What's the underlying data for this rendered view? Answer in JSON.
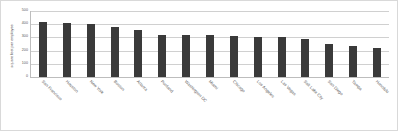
{
  "chart_data": {
    "type": "bar",
    "title": "",
    "xlabel": "",
    "ylabel": "square feet per employee",
    "ylim": [
      0,
      500
    ],
    "yticks": [
      500,
      400,
      300,
      200,
      100,
      0
    ],
    "grid": true,
    "legend": false,
    "orientation": "vertical",
    "bar_color": "#3a3a3a",
    "categories": [
      "San Francisco",
      "Houston",
      "New York",
      "Boston",
      "Atlanta",
      "Portland",
      "Washington DC",
      "Miami",
      "Chicago",
      "Los Angeles",
      "Las Vegas",
      "Salt Lake City",
      "San Diego",
      "Tampa",
      "Honolulu"
    ],
    "values": [
      415,
      408,
      403,
      382,
      355,
      322,
      318,
      315,
      310,
      303,
      300,
      290,
      248,
      235,
      218
    ]
  },
  "colors": {
    "bar": "#3a3a3a",
    "gridline": "#d0d0d0",
    "axis": "#bdbdbd",
    "text": "#555555",
    "background": "#ffffff",
    "border": "#d9d9d9"
  }
}
